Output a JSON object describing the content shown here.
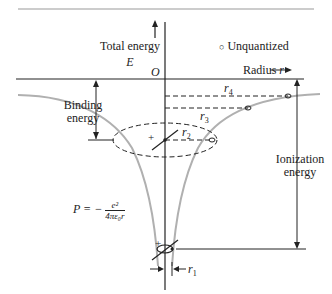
{
  "labels": {
    "total_energy": "Total energy",
    "E": "E",
    "origin": "O",
    "unquantized": "Unquantized",
    "radius": "Radius",
    "radius_var": "r",
    "binding_energy_line1": "Binding",
    "binding_energy_line2": "energy",
    "ionization_energy_line1": "Ionization",
    "ionization_energy_line2": "energy",
    "r4": "r",
    "r4_sub": "4",
    "r3": "r",
    "r3_sub": "3",
    "r2": "r",
    "r2_sub": "2",
    "r1": "r",
    "r1_sub": "1",
    "formula_P": "P = −",
    "formula_num": "e²",
    "formula_den": "4πε₀r",
    "plus": "+"
  },
  "colors": {
    "curve": "#b0b0b0",
    "ink": "#222222",
    "rule": "#999999"
  }
}
